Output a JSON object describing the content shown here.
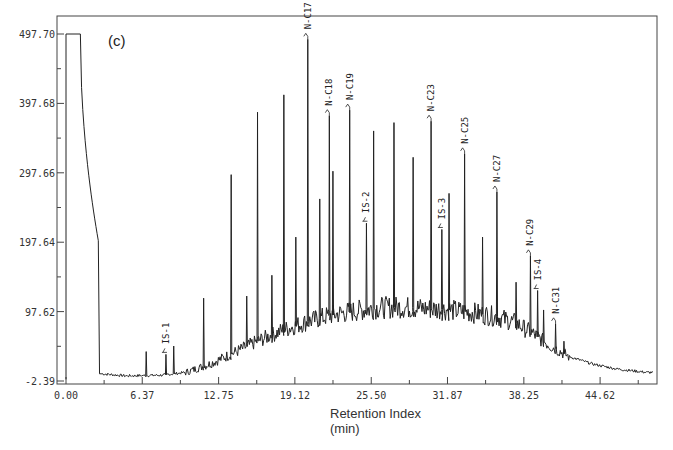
{
  "chart_data": {
    "type": "line",
    "title": "",
    "panel_label": "(c)",
    "xlabel": "Retention Index",
    "xlabel_unit": "(min)",
    "ylabel": "",
    "xlim": [
      -0.8,
      49.3
    ],
    "ylim": [
      -2.39,
      497.7
    ],
    "xticks": [
      0.0,
      6.37,
      12.75,
      19.12,
      25.5,
      31.87,
      38.25,
      44.62
    ],
    "xtick_labels": [
      "0.00",
      "6.37",
      "12.75",
      "19.12",
      "25.50",
      "31.87",
      "38.25",
      "44.62"
    ],
    "yticks": [
      -2.39,
      97.62,
      197.64,
      297.66,
      397.68,
      497.7
    ],
    "ytick_labels": [
      "-2.39",
      "97.62",
      "197.64",
      "297.66",
      "397.68",
      "497.70"
    ],
    "grid": false,
    "solvent_front": {
      "start": 0.0,
      "plateau_end": 1.2,
      "drop_end": 2.8,
      "drop_value": 190,
      "plateau_value": 497.7
    },
    "baseline": [
      [
        3.0,
        8
      ],
      [
        5,
        5
      ],
      [
        8,
        6
      ],
      [
        10,
        10
      ],
      [
        12,
        22
      ],
      [
        14,
        38
      ],
      [
        16,
        55
      ],
      [
        18,
        70
      ],
      [
        20,
        82
      ],
      [
        22,
        92
      ],
      [
        24,
        98
      ],
      [
        26,
        103
      ],
      [
        28,
        104
      ],
      [
        30,
        102
      ],
      [
        32,
        100
      ],
      [
        34,
        96
      ],
      [
        36,
        90
      ],
      [
        37.5,
        82
      ],
      [
        39,
        66
      ],
      [
        40.5,
        48
      ],
      [
        42,
        33
      ],
      [
        44,
        22
      ],
      [
        46,
        15
      ],
      [
        48.5,
        10
      ]
    ],
    "peaks": [
      {
        "t": 6.7,
        "v": 40
      },
      {
        "t": 8.35,
        "v": 36,
        "label": "IS-1"
      },
      {
        "t": 9.0,
        "v": 48
      },
      {
        "t": 11.5,
        "v": 117
      },
      {
        "t": 13.8,
        "v": 295
      },
      {
        "t": 15.1,
        "v": 120
      },
      {
        "t": 16.0,
        "v": 385
      },
      {
        "t": 17.2,
        "v": 150
      },
      {
        "t": 18.2,
        "v": 410
      },
      {
        "t": 19.2,
        "v": 205
      },
      {
        "t": 20.2,
        "v": 490,
        "label": "N-C17"
      },
      {
        "t": 21.2,
        "v": 260
      },
      {
        "t": 22.0,
        "v": 380,
        "label": "N-C18"
      },
      {
        "t": 22.3,
        "v": 300
      },
      {
        "t": 23.7,
        "v": 388,
        "label": "N-C19"
      },
      {
        "t": 25.1,
        "v": 225,
        "label": "IS-2"
      },
      {
        "t": 25.7,
        "v": 358
      },
      {
        "t": 27.4,
        "v": 370
      },
      {
        "t": 29.0,
        "v": 320
      },
      {
        "t": 30.5,
        "v": 372,
        "label": "N-C23"
      },
      {
        "t": 31.4,
        "v": 216,
        "label": "IS-3"
      },
      {
        "t": 32.0,
        "v": 268
      },
      {
        "t": 33.3,
        "v": 325,
        "label": "N-C25"
      },
      {
        "t": 34.8,
        "v": 205
      },
      {
        "t": 36.0,
        "v": 270,
        "label": "N-C27"
      },
      {
        "t": 37.6,
        "v": 140
      },
      {
        "t": 38.8,
        "v": 178,
        "label": "N-C29"
      },
      {
        "t": 39.4,
        "v": 128,
        "label": "IS-4"
      },
      {
        "t": 39.9,
        "v": 100
      },
      {
        "t": 40.9,
        "v": 80,
        "label": "N-C31"
      },
      {
        "t": 41.6,
        "v": 55
      }
    ]
  }
}
